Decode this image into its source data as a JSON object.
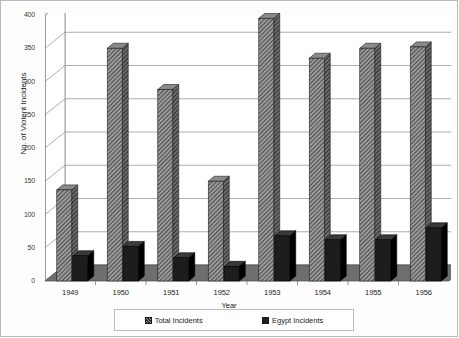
{
  "chart_data": {
    "type": "bar",
    "title": "",
    "xlabel": "Year",
    "ylabel": "No. of Violent Incidents",
    "categories": [
      "1949",
      "1950",
      "1951",
      "1952",
      "1953",
      "1954",
      "1955",
      "1956"
    ],
    "series": [
      {
        "name": "Total Incidents",
        "values": [
          137,
          350,
          288,
          150,
          395,
          335,
          350,
          352
        ]
      },
      {
        "name": "Egypt Incidents",
        "values": [
          38,
          52,
          35,
          22,
          68,
          62,
          62,
          80
        ]
      }
    ],
    "ylim": [
      0,
      400
    ],
    "yticks": [
      "0",
      "50",
      "100",
      "150",
      "200",
      "250",
      "300",
      "350",
      "400"
    ],
    "ytick_values": [
      0,
      50,
      100,
      150,
      200,
      250,
      300,
      350,
      400
    ],
    "grid": true,
    "legend_position": "bottom",
    "style": "3d-bar"
  },
  "legend": {
    "entries": [
      {
        "label": "Total Incidents",
        "swatch": "hatched"
      },
      {
        "label": "Egypt Incidents",
        "swatch": "solid"
      }
    ]
  },
  "colors": {
    "total_fill": "#9a9a9a",
    "total_hatch": "#2b2b2b",
    "egypt_fill": "#1d1d1d",
    "floor": "#6e6e6e",
    "wall": "#ffffff",
    "grid": "#8c8c8c",
    "frame": "#b9b9b9"
  }
}
